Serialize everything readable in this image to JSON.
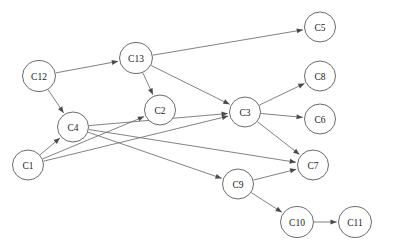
{
  "diagram": {
    "type": "directed-graph",
    "title": "",
    "width": 395,
    "height": 250,
    "background_color": "#ffffff",
    "node_fill_color": "#ffffff",
    "node_stroke_color": "#5a5a5a",
    "edge_color": "#6b6b6b",
    "label_color": "#1a1a1a",
    "node_radius": 15.5,
    "nodes": [
      {
        "id": "C12",
        "label": "C12",
        "x": 39,
        "y": 76,
        "rx": 16.5,
        "ry": 15.5
      },
      {
        "id": "C13",
        "label": "C13",
        "x": 136,
        "y": 58,
        "rx": 16.5,
        "ry": 15.5
      },
      {
        "id": "C5",
        "label": "C5",
        "x": 320,
        "y": 27,
        "rx": 15.5,
        "ry": 15.0
      },
      {
        "id": "C8",
        "label": "C8",
        "x": 320,
        "y": 76,
        "rx": 15.5,
        "ry": 15.0
      },
      {
        "id": "C2",
        "label": "C2",
        "x": 160,
        "y": 110,
        "rx": 15.5,
        "ry": 15.0
      },
      {
        "id": "C3",
        "label": "C3",
        "x": 245,
        "y": 112,
        "rx": 15.5,
        "ry": 15.0
      },
      {
        "id": "C6",
        "label": "C6",
        "x": 320,
        "y": 119,
        "rx": 15.5,
        "ry": 15.0
      },
      {
        "id": "C4",
        "label": "C4",
        "x": 73,
        "y": 127,
        "rx": 15.5,
        "ry": 15.0
      },
      {
        "id": "C1",
        "label": "C1",
        "x": 28,
        "y": 165,
        "rx": 15.5,
        "ry": 15.0
      },
      {
        "id": "C7",
        "label": "C7",
        "x": 313,
        "y": 165,
        "rx": 15.5,
        "ry": 15.0
      },
      {
        "id": "C9",
        "label": "C9",
        "x": 238,
        "y": 184,
        "rx": 15.5,
        "ry": 15.0
      },
      {
        "id": "C10",
        "label": "C10",
        "x": 297,
        "y": 222,
        "rx": 16.5,
        "ry": 15.5
      },
      {
        "id": "C11",
        "label": "C11",
        "x": 355,
        "y": 222,
        "rx": 16.5,
        "ry": 15.5
      }
    ],
    "edges": [
      {
        "from": "C12",
        "to": "C13",
        "directed": true
      },
      {
        "from": "C12",
        "to": "C4",
        "directed": true
      },
      {
        "from": "C13",
        "to": "C5",
        "directed": true
      },
      {
        "from": "C13",
        "to": "C2",
        "directed": true
      },
      {
        "from": "C13",
        "to": "C3",
        "directed": true
      },
      {
        "from": "C3",
        "to": "C8",
        "directed": true
      },
      {
        "from": "C3",
        "to": "C6",
        "directed": true
      },
      {
        "from": "C3",
        "to": "C7",
        "directed": true
      },
      {
        "from": "C4",
        "to": "C3",
        "directed": true
      },
      {
        "from": "C4",
        "to": "C7",
        "directed": true
      },
      {
        "from": "C4",
        "to": "C9",
        "directed": true
      },
      {
        "from": "C1",
        "to": "C4",
        "directed": true
      },
      {
        "from": "C1",
        "to": "C2",
        "directed": true
      },
      {
        "from": "C1",
        "to": "C3",
        "directed": true
      },
      {
        "from": "C9",
        "to": "C7",
        "directed": true
      },
      {
        "from": "C9",
        "to": "C10",
        "directed": true
      },
      {
        "from": "C10",
        "to": "C11",
        "directed": true
      }
    ]
  }
}
